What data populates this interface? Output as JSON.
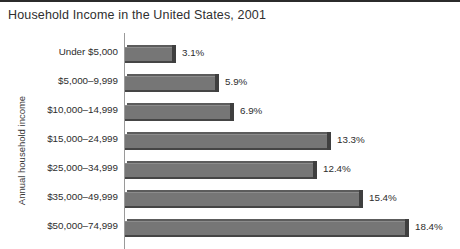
{
  "chart_data": {
    "type": "bar",
    "orientation": "horizontal",
    "title": "Household Income in the United States, 2001",
    "xlabel": "",
    "ylabel": "Annual household income",
    "grid": false,
    "legend": null,
    "value_suffix": "%",
    "xlim": [
      0,
      18.4
    ],
    "categories": [
      "Under $5,000",
      "$5,000–9,999",
      "$10,000–14,999",
      "$15,000–24,999",
      "$25,000–34,999",
      "$35,000–49,999",
      "$50,000–74,999"
    ],
    "values": [
      3.1,
      5.9,
      6.9,
      13.3,
      12.4,
      15.4,
      18.4
    ],
    "value_labels": [
      "3.1%",
      "5.9%",
      "6.9%",
      "13.3%",
      "12.4%",
      "15.4%",
      "18.4%"
    ],
    "colors": {
      "bar_face": "#767676",
      "bar_edge": "#3f3f3f",
      "axis": "#9a9a9a",
      "text": "#2d2d2d",
      "title": "#2f2f2f",
      "top_rule": "#2b2b2b",
      "background": "#ffffff"
    }
  },
  "figure": {
    "top_rule_present": true
  }
}
